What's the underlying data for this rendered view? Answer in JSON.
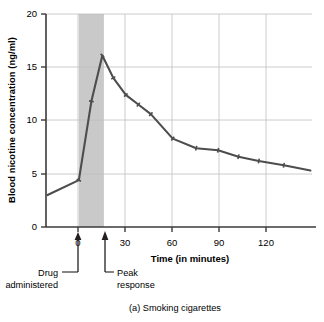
{
  "chart_data": {
    "type": "line",
    "title": "",
    "caption": "(a) Smoking cigarettes",
    "xlabel": "Time (in minutes)",
    "ylabel": "Blood nicotine concentration (ng/ml)",
    "xlim": [
      -21,
      149
    ],
    "ylim": [
      0,
      20
    ],
    "xticks": [
      0,
      30,
      60,
      90,
      120
    ],
    "xtick_labels": [
      "0",
      "30",
      "60",
      "90",
      "120"
    ],
    "yticks": [
      0,
      5,
      10,
      15,
      20
    ],
    "ytick_labels": [
      "0",
      "5",
      "10",
      "15",
      "20"
    ],
    "grid": "both",
    "legend": "none",
    "line_color": "#4d4d4d",
    "marker": "tick",
    "series": [
      {
        "name": "Blood nicotine concentration",
        "x": [
          -20,
          0,
          8,
          15,
          22,
          30,
          38,
          46,
          60,
          75,
          89,
          102,
          115,
          131,
          148
        ],
        "y": [
          3.0,
          4.4,
          11.8,
          16.1,
          14.0,
          12.4,
          11.5,
          10.6,
          8.3,
          7.4,
          7.2,
          6.6,
          6.2,
          5.8,
          5.3
        ]
      }
    ],
    "shaded_region": {
      "label": "smoking period",
      "x_start": 0,
      "x_end": 16,
      "color": "#c9c9c9"
    },
    "annotations": [
      {
        "name": "drug-administered",
        "line1": "Drug",
        "line2": "administered",
        "points_to_x": 0
      },
      {
        "name": "peak-response",
        "line1": "Peak",
        "line2": "response",
        "points_to_x": 17
      }
    ]
  }
}
